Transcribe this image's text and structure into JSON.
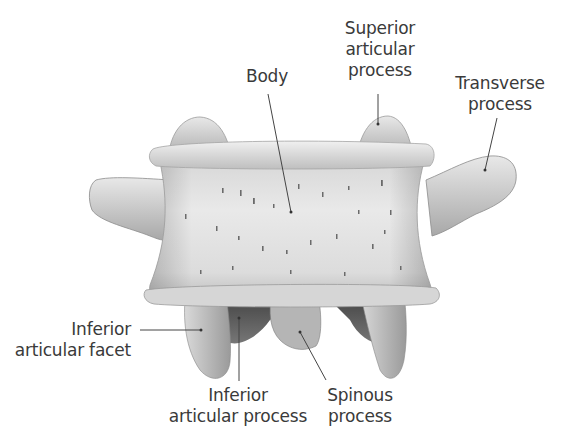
{
  "figure": {
    "colors": {
      "background": "#ffffff",
      "bone_light": "#e6e6e6",
      "bone_mid": "#c9c9c9",
      "bone_shadow": "#8c8c8c",
      "bone_dark": "#555555",
      "label_text": "#3a3a3a",
      "leader_line": "#444444"
    }
  },
  "labels": {
    "body": "Body",
    "superior_articular_process": "Superior\narticular\nprocess",
    "transverse_process": "Transverse\nprocess",
    "inferior_articular_facet": "Inferior\narticular facet",
    "inferior_articular_process": "Inferior\narticular process",
    "spinous_process": "Spinous\nprocess"
  }
}
